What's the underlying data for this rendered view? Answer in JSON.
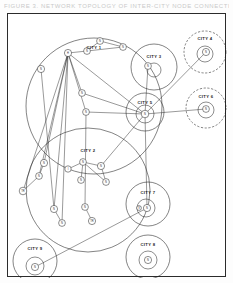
{
  "caption": {
    "text": "FIGURE 3. NETWORK TOPOLOGY OF INTER-CITY NODE CONNECTIONS"
  },
  "figure": {
    "background_color": "#ffffff",
    "frame_color": "#2b2b2b",
    "stroke_color": "#1d1d1d",
    "node_fill": "#ffffff",
    "width": 219,
    "height": 264
  },
  "chart_data": {
    "type": "diagram",
    "title": "FIGURE 3. NETWORK TOPOLOGY OF INTER-CITY NODE CONNECTIONS",
    "cities": [
      {
        "id": "city1",
        "label": "CITY 1",
        "cx": 86,
        "cy": 92,
        "r": 68,
        "style": "solid",
        "label_x": 86,
        "label_y": 35
      },
      {
        "id": "city2",
        "label": "CITY 2",
        "cx": 80,
        "cy": 176,
        "r": 62,
        "style": "solid",
        "label_x": 80,
        "label_y": 138
      },
      {
        "id": "city3",
        "label": "CITY 3",
        "cx": 146,
        "cy": 53,
        "r": 23,
        "style": "solid",
        "label_x": 146,
        "label_y": 44
      },
      {
        "id": "city4",
        "label": "CITY 4",
        "cx": 197,
        "cy": 38,
        "r": 21,
        "style": "dashed",
        "label_x": 197,
        "label_y": 26
      },
      {
        "id": "city5",
        "label": "CITY 5",
        "cx": 137,
        "cy": 98,
        "r": 19,
        "style": "solid",
        "label_x": 137,
        "label_y": 90
      },
      {
        "id": "city6",
        "label": "CITY 6",
        "cx": 198,
        "cy": 94,
        "r": 20,
        "style": "dashed",
        "label_x": 198,
        "label_y": 84
      },
      {
        "id": "city7",
        "label": "CITY 7",
        "cx": 140,
        "cy": 190,
        "r": 22,
        "style": "solid",
        "label_x": 140,
        "label_y": 180
      },
      {
        "id": "city8",
        "label": "CITY 8",
        "cx": 140,
        "cy": 243,
        "r": 22,
        "style": "solid",
        "label_x": 140,
        "label_y": 232
      },
      {
        "id": "city9",
        "label": "CITY 9",
        "cx": 27,
        "cy": 247,
        "r": 22,
        "style": "solid",
        "label_x": 27,
        "label_y": 236
      }
    ],
    "inner_rings": [
      {
        "id": "ring-city3",
        "cx": 146,
        "cy": 56,
        "r": 7
      },
      {
        "id": "ring-city4",
        "cx": 197,
        "cy": 40,
        "r": 8
      },
      {
        "id": "ring-city5",
        "cx": 137,
        "cy": 100,
        "r": 9
      },
      {
        "id": "ring-city6",
        "cx": 198,
        "cy": 96,
        "r": 8
      },
      {
        "id": "ring-city7",
        "cx": 138,
        "cy": 194,
        "r": 9
      },
      {
        "id": "ring-city8",
        "cx": 140,
        "cy": 246,
        "r": 9
      },
      {
        "id": "ring-city9",
        "cx": 27,
        "cy": 252,
        "r": 9
      }
    ],
    "nodes": [
      {
        "id": "n1",
        "label": "H",
        "cx": 60,
        "cy": 39,
        "r": 3.6,
        "city": "city1"
      },
      {
        "id": "n2",
        "label": "N",
        "cx": 79,
        "cy": 37,
        "r": 3.4,
        "city": "city1"
      },
      {
        "id": "n3",
        "label": "N",
        "cx": 92,
        "cy": 27,
        "r": 3.4,
        "city": "city1"
      },
      {
        "id": "n4",
        "label": "N",
        "cx": 115,
        "cy": 33,
        "r": 3.4,
        "city": "city1"
      },
      {
        "id": "n5",
        "label": "N",
        "cx": 33,
        "cy": 55,
        "r": 3.6,
        "city": "city1"
      },
      {
        "id": "n6",
        "label": "N",
        "cx": 74,
        "cy": 79,
        "r": 3.4,
        "city": "city1"
      },
      {
        "id": "n7",
        "label": "N",
        "cx": 78,
        "cy": 98,
        "r": 3.4,
        "city": "city1"
      },
      {
        "id": "n8",
        "label": "N",
        "cx": 140,
        "cy": 52,
        "r": 3.4,
        "city": "city3"
      },
      {
        "id": "n9",
        "label": "N",
        "cx": 198,
        "cy": 38,
        "r": 3.6,
        "city": "city4"
      },
      {
        "id": "n10",
        "label": "N",
        "cx": 137,
        "cy": 100,
        "r": 3.8,
        "city": "city5"
      },
      {
        "id": "n11",
        "label": "N",
        "cx": 198,
        "cy": 95,
        "r": 3.4,
        "city": "city6"
      },
      {
        "id": "n12",
        "label": "N",
        "cx": 36,
        "cy": 149,
        "r": 3.6,
        "city": "city2"
      },
      {
        "id": "n13",
        "label": "N",
        "cx": 31,
        "cy": 162,
        "r": 3.4,
        "city": "city2"
      },
      {
        "id": "n14",
        "label": "TR",
        "cx": 15,
        "cy": 177,
        "r": 3.8,
        "city": "city2"
      },
      {
        "id": "n15",
        "label": "I",
        "cx": 60,
        "cy": 155,
        "r": 3.2,
        "city": "city2"
      },
      {
        "id": "n16",
        "label": "N",
        "cx": 75,
        "cy": 148,
        "r": 3.4,
        "city": "city2"
      },
      {
        "id": "n17",
        "label": "N",
        "cx": 73,
        "cy": 166,
        "r": 3.4,
        "city": "city2"
      },
      {
        "id": "n18",
        "label": "N",
        "cx": 93,
        "cy": 152,
        "r": 3.6,
        "city": "city2"
      },
      {
        "id": "n19",
        "label": "N",
        "cx": 98,
        "cy": 168,
        "r": 3.4,
        "city": "city2"
      },
      {
        "id": "n20",
        "label": "N",
        "cx": 46,
        "cy": 195,
        "r": 3.6,
        "city": "city2"
      },
      {
        "id": "n21",
        "label": "N",
        "cx": 54,
        "cy": 209,
        "r": 3.4,
        "city": "city2"
      },
      {
        "id": "n22",
        "label": "N",
        "cx": 77,
        "cy": 193,
        "r": 3.4,
        "city": "city2"
      },
      {
        "id": "n23",
        "label": "TR",
        "cx": 84,
        "cy": 207,
        "r": 3.6,
        "city": "city2"
      },
      {
        "id": "n24",
        "label": "N",
        "cx": 139,
        "cy": 194,
        "r": 3.6,
        "city": "city7"
      },
      {
        "id": "n25",
        "label": "V",
        "cx": 131,
        "cy": 194,
        "r": 2.4,
        "city": "city7"
      },
      {
        "id": "n26",
        "label": "N",
        "cx": 140,
        "cy": 246,
        "r": 3.6,
        "city": "city8"
      },
      {
        "id": "n27",
        "label": "N",
        "cx": 27,
        "cy": 253,
        "r": 3.6,
        "city": "city9"
      }
    ],
    "edges": [
      {
        "from": "n1",
        "to": "n2"
      },
      {
        "from": "n2",
        "to": "n3"
      },
      {
        "from": "n2",
        "to": "n4"
      },
      {
        "from": "n3",
        "to": "n4"
      },
      {
        "from": "n1",
        "to": "n6"
      },
      {
        "from": "n1",
        "to": "n7"
      },
      {
        "from": "n1",
        "to": "n10"
      },
      {
        "from": "n1",
        "to": "n12"
      },
      {
        "from": "n1",
        "to": "n13"
      },
      {
        "from": "n1",
        "to": "n14"
      },
      {
        "from": "n1",
        "to": "n20"
      },
      {
        "from": "n1",
        "to": "n21"
      },
      {
        "from": "n5",
        "to": "n20"
      },
      {
        "from": "n6",
        "to": "n10"
      },
      {
        "from": "n7",
        "to": "n10"
      },
      {
        "from": "n7",
        "to": "n22"
      },
      {
        "from": "n8",
        "to": "n10"
      },
      {
        "from": "n9",
        "to": "n10"
      },
      {
        "from": "n10",
        "to": "n11"
      },
      {
        "from": "n10",
        "to": "n18"
      },
      {
        "from": "n10",
        "to": "n24"
      },
      {
        "from": "n15",
        "to": "n16"
      },
      {
        "from": "n16",
        "to": "n17"
      },
      {
        "from": "n16",
        "to": "n18"
      },
      {
        "from": "n16",
        "to": "n19"
      },
      {
        "from": "n18",
        "to": "n19"
      },
      {
        "from": "n20",
        "to": "n21"
      },
      {
        "from": "n22",
        "to": "n23"
      },
      {
        "from": "n24",
        "to": "n27"
      },
      {
        "from": "n12",
        "to": "n13"
      },
      {
        "from": "n13",
        "to": "n14"
      }
    ]
  }
}
